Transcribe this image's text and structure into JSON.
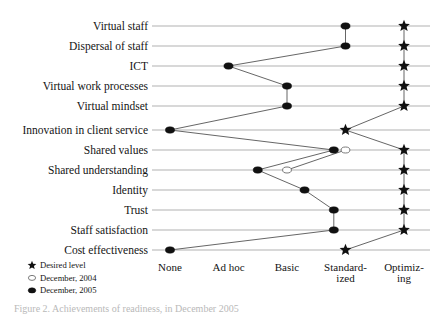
{
  "chart_data": {
    "type": "scatter",
    "title": "",
    "xlabel": "",
    "ylabel": "",
    "orientation": "horizontal",
    "grid": true,
    "legend_position": "bottom-left",
    "categories": [
      "Virtual staff",
      "Dispersal of staff",
      "ICT",
      "Virtual work processes",
      "Virtual mindset",
      "Innovation in client service",
      "Shared values",
      "Shared understanding",
      "Identity",
      "Trust",
      "Staff satisfaction",
      "Cost effectiveness"
    ],
    "x_tick_labels": [
      "None",
      "Ad hoc",
      "Basic",
      "Standard-ized",
      "Optimiz-ing"
    ],
    "x_tick_labels_wrapped": [
      [
        "None",
        ""
      ],
      [
        "Ad hoc",
        ""
      ],
      [
        "Basic",
        ""
      ],
      [
        "Standard-",
        "ized"
      ],
      [
        "Optimiz-",
        "ing"
      ]
    ],
    "x_levels": [
      "None",
      "Ad hoc",
      "Basic",
      "Standardized",
      "Optimizing"
    ],
    "xlim": [
      0,
      4
    ],
    "series": [
      {
        "name": "Desired level",
        "marker": "star",
        "marker_style": "filled-star",
        "values": [
          4,
          4,
          4,
          4,
          4,
          3,
          4,
          4,
          4,
          4,
          4,
          3
        ],
        "value_labels": [
          "Optimizing",
          "Optimizing",
          "Optimizing",
          "Optimizing",
          "Optimizing",
          "Standardized",
          "Optimizing",
          "Optimizing",
          "Optimizing",
          "Optimizing",
          "Optimizing",
          "Standardized"
        ],
        "connected": true
      },
      {
        "name": "December, 2004",
        "marker": "open-circle",
        "marker_style": "hollow-ellipse",
        "values": [
          null,
          null,
          null,
          null,
          null,
          null,
          3,
          2,
          null,
          null,
          null,
          null
        ],
        "value_labels": [
          "",
          "",
          "",
          "",
          "",
          "",
          "Standardized",
          "Basic",
          "",
          "",
          "",
          ""
        ],
        "connected": true
      },
      {
        "name": "December, 2005",
        "marker": "filled-circle",
        "marker_style": "filled-ellipse",
        "values": [
          3,
          3,
          1,
          2,
          2,
          0,
          2.8,
          1.5,
          2.3,
          2.8,
          2.8,
          0
        ],
        "value_labels": [
          "Standardized",
          "Standardized",
          "Ad hoc",
          "Basic",
          "Basic",
          "None",
          "Basic+",
          "Ad hoc+",
          "Basic",
          "Basic+",
          "Basic+",
          "None"
        ],
        "connected": true
      }
    ]
  },
  "legend": {
    "items": [
      {
        "label": "Desired level",
        "marker": "star"
      },
      {
        "label": "December, 2004",
        "marker": "open-circle"
      },
      {
        "label": "December, 2005",
        "marker": "filled-circle"
      }
    ]
  },
  "caption": {
    "text": "Figure 2. Achievements of readiness, in December 2005"
  },
  "colors": {
    "marker_filled": "#111111",
    "marker_open_stroke": "#6b6b6b",
    "gridline": "#a8a8a8",
    "series_line": "#4a4a4a",
    "text": "#141414"
  }
}
